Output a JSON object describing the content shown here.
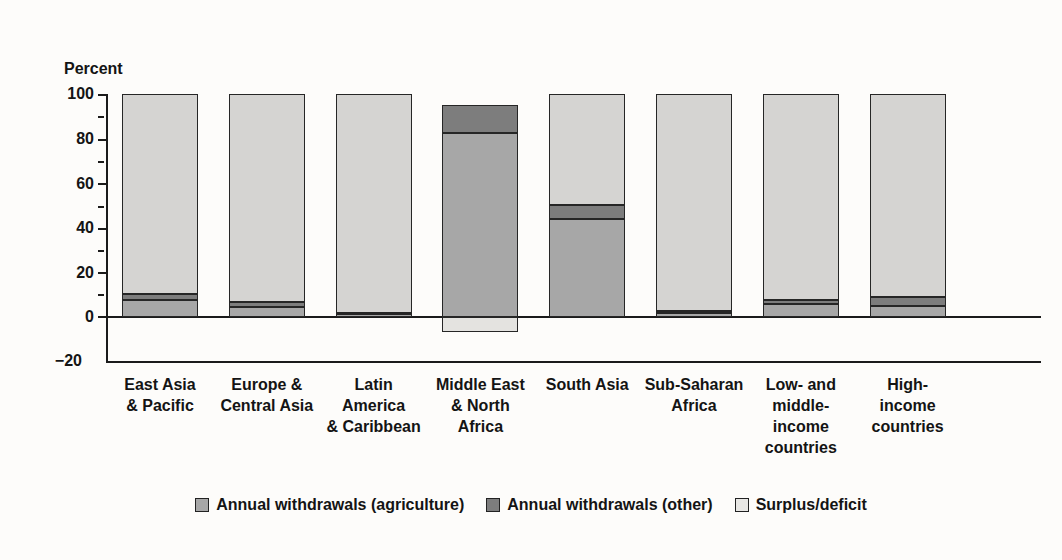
{
  "figure": {
    "top_caption": "",
    "y_axis_title": "Percent"
  },
  "legend": {
    "position": "bottom-center",
    "items": [
      {
        "label": "Annual withdrawals (agriculture)",
        "color": "#a7a7a7",
        "icon": "legend-swatch-icon"
      },
      {
        "label": "Annual withdrawals (other)",
        "color": "#7d7d7d",
        "icon": "legend-swatch-icon"
      },
      {
        "label": "Surplus/deficit",
        "color": "#e8e7e4",
        "icon": "legend-swatch-icon"
      }
    ]
  },
  "axes": {
    "y_title": "Percent",
    "y_ticks": [
      "100",
      "80",
      "60",
      "40",
      "20",
      "0",
      "−20"
    ],
    "y_min": -20,
    "y_max": 100,
    "grid": false
  },
  "chart_data": {
    "type": "bar",
    "title": "",
    "subtitle": "",
    "xlabel": "",
    "ylabel": "Percent",
    "ylim": [
      -20,
      100
    ],
    "ytick_values": [
      100,
      80,
      60,
      40,
      20,
      0,
      -20
    ],
    "ytick_labels": [
      "100",
      "80",
      "60",
      "40",
      "20",
      "0",
      "−20"
    ],
    "grid": false,
    "stacked": true,
    "legend_position": "bottom-center",
    "categories": [
      "East Asia & Pacific",
      "Europe & Central Asia",
      "Latin America & Caribbean",
      "Middle East & North Africa",
      "South Asia",
      "Sub-Saharan Africa",
      "Low- and middle-income countries",
      "High-income countries"
    ],
    "category_lines": [
      [
        "East Asia",
        "& Pacific"
      ],
      [
        "Europe &",
        "Central Asia"
      ],
      [
        "Latin",
        "America",
        "& Caribbean"
      ],
      [
        "Middle East",
        "& North",
        "Africa"
      ],
      [
        "South Asia"
      ],
      [
        "Sub-Saharan",
        "Africa"
      ],
      [
        "Low- and",
        "middle-",
        "income",
        "countries"
      ],
      [
        "High-",
        "income",
        "countries"
      ]
    ],
    "series": [
      {
        "name": "Annual withdrawals (agriculture)",
        "color": "#a7a7a7",
        "values": [
          7.6,
          4.5,
          1.5,
          82.5,
          44.0,
          1.8,
          5.8,
          4.9
        ]
      },
      {
        "name": "Annual withdrawals (other)",
        "color": "#7d7d7d",
        "values": [
          2.7,
          2.2,
          0.4,
          12.5,
          6.3,
          1.1,
          2.0,
          4.0
        ]
      },
      {
        "name": "Surplus/deficit",
        "color": "#e8e7e4",
        "values": [
          89.7,
          93.3,
          98.1,
          -6.7,
          49.7,
          97.1,
          92.2,
          91.1
        ]
      }
    ]
  }
}
